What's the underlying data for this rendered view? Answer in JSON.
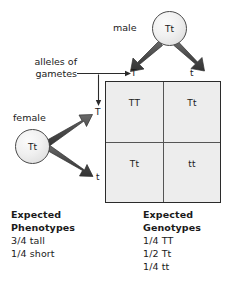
{
  "diagram": {
    "parents": {
      "male": {
        "label": "male",
        "genotype": "Tt"
      },
      "female": {
        "label": "female",
        "genotype": "Tt"
      }
    },
    "gamete_note": {
      "line1": "alleles of",
      "line2": "gametes"
    },
    "column_headers": [
      "T",
      "t"
    ],
    "row_headers": [
      "T",
      "t"
    ],
    "cells": [
      {
        "genotype": "TT"
      },
      {
        "genotype": "Tt"
      },
      {
        "genotype": "Tt"
      },
      {
        "genotype": "tt"
      }
    ],
    "phenotypes": {
      "heading_line1": "Expected",
      "heading_line2": "Phenotypes",
      "ratios": [
        "3/4 tall",
        "1/4 short"
      ]
    },
    "genotypes": {
      "heading_line1": "Expected",
      "heading_line2": "Genotypes",
      "ratios": [
        "1/4 TT",
        "1/2 Tt",
        "1/4 tt"
      ]
    },
    "colors": {
      "cell_fill": "#ededed",
      "grid_border": "#2b2b2b",
      "grid_divider": "#555555",
      "arrow": "#4d4d4d",
      "text": "#1a1a1a"
    }
  }
}
